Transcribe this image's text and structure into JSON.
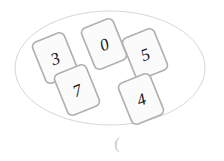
{
  "canvas": {
    "width": 224,
    "height": 161,
    "background": "#ffffff"
  },
  "ellipse": {
    "name": "boundary-ellipse",
    "center_x": 110,
    "center_y": 68,
    "radius_x": 95,
    "radius_y": 57,
    "stroke": "#d6d6d6",
    "stroke_width": 1,
    "fill": "none"
  },
  "cards": {
    "style": {
      "fill": "#fbfbfb",
      "stroke": "#b0b0b0",
      "stroke_width": 1.6,
      "corner_radius": 5,
      "width": 34,
      "height": 44,
      "rotation_deg": -22,
      "font_size": 17
    },
    "items": [
      {
        "name": "card-3",
        "value": "3",
        "center_x": 55,
        "center_y": 58,
        "rotation_deg": -22
      },
      {
        "name": "card-0",
        "value": "0",
        "center_x": 104,
        "center_y": 44,
        "rotation_deg": -22
      },
      {
        "name": "card-5",
        "value": "5",
        "center_x": 145,
        "center_y": 54,
        "rotation_deg": -22
      },
      {
        "name": "card-7",
        "value": "7",
        "center_x": 77,
        "center_y": 90,
        "rotation_deg": -22
      },
      {
        "name": "card-4",
        "value": "4",
        "center_x": 141,
        "center_y": 99,
        "rotation_deg": -22
      }
    ]
  },
  "caption": {
    "name": "paren-caption",
    "text": "(",
    "x": 117,
    "y": 143,
    "font_size": 17,
    "color": "#c9c9c9"
  }
}
